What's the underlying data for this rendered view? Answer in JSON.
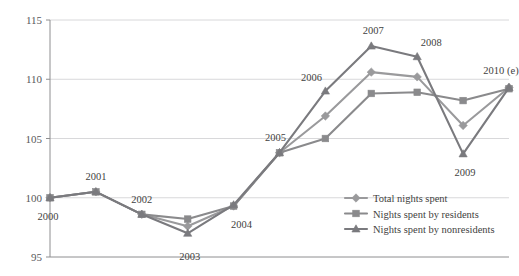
{
  "chart_data": {
    "type": "line",
    "title": "",
    "subtitle": "",
    "xlabel": "",
    "ylabel": "",
    "categories": [
      "2000",
      "2001",
      "2002",
      "2003",
      "2004",
      "2005",
      "2006",
      "2007",
      "2008",
      "2009",
      "2010 (e)"
    ],
    "point_labels": [
      "2000",
      "2001",
      "2002",
      "2003",
      "2004",
      "2005",
      "2006",
      "2007",
      "2008",
      "2009",
      "2010 (e)"
    ],
    "xlim": [
      0,
      10
    ],
    "ylim": [
      95,
      115
    ],
    "yticks": [
      95,
      100,
      105,
      110,
      115
    ],
    "ytick_labels": [
      "95",
      "100",
      "105",
      "110",
      "115"
    ],
    "grid": true,
    "grid_axis": "y",
    "legend_position": "inside-bottom-right",
    "series": [
      {
        "name": "Total nights spent",
        "color": "#9a9a9c",
        "marker": "diamond",
        "values": [
          100.0,
          100.5,
          98.6,
          97.6,
          99.3,
          103.8,
          106.9,
          110.6,
          110.2,
          106.1,
          109.3
        ]
      },
      {
        "name": "Nights spent by residents",
        "color": "#8a8a8c",
        "marker": "square",
        "values": [
          100.0,
          100.5,
          98.6,
          98.2,
          99.3,
          103.8,
          105.0,
          108.8,
          108.9,
          108.2,
          109.2
        ]
      },
      {
        "name": "Nights spent by nonresidents",
        "color": "#7a7a7e",
        "marker": "triangle",
        "values": [
          100.0,
          100.5,
          98.6,
          97.0,
          99.4,
          103.8,
          109.0,
          112.8,
          111.9,
          103.7,
          109.3
        ]
      }
    ]
  },
  "legend": {
    "items": [
      {
        "label": "Total nights spent"
      },
      {
        "label": "Nights spent by residents"
      },
      {
        "label": "Nights spent by nonresidents"
      }
    ]
  },
  "axis": {
    "y_axis_name": "value-axis",
    "x_axis_name": "year-axis"
  }
}
